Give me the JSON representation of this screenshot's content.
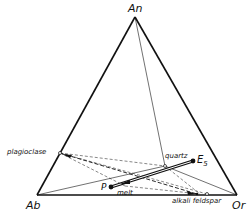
{
  "diagram": {
    "type": "ternary-phase-diagram",
    "vertices": {
      "top": "An",
      "left": "Ab",
      "right": "Or"
    },
    "labels": {
      "plagioclase": "plagioclase",
      "quartz": "quartz",
      "e5": "E",
      "e5_sub": "5",
      "p": "P",
      "melt": "melt",
      "alkali_feldspar": "alkali feldspar"
    },
    "points": {
      "An": [
        135,
        17
      ],
      "Ab": [
        37,
        195
      ],
      "Or": [
        237,
        195
      ],
      "plagioclase": [
        60,
        153
      ],
      "quartz": [
        165,
        166
      ],
      "E5": [
        193,
        161
      ],
      "P": [
        111,
        187
      ],
      "alkali_feldspar_a": [
        197,
        194
      ],
      "alkali_feldspar_b": [
        207,
        194
      ]
    },
    "colors": {
      "line": "#111111",
      "background": "#ffffff"
    }
  }
}
